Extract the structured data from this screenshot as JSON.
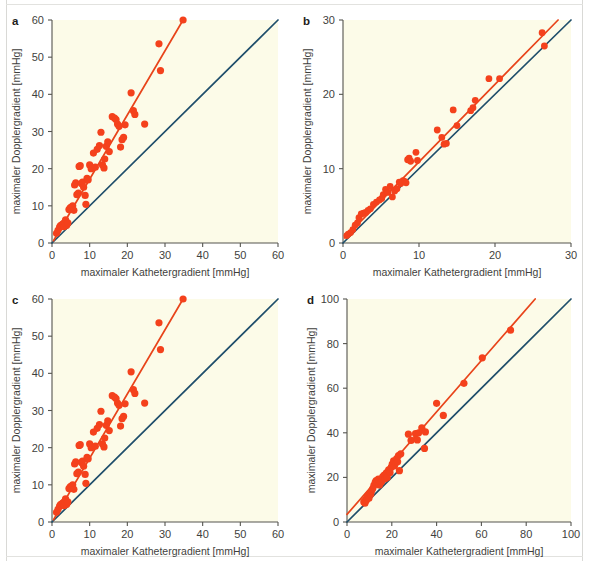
{
  "figure": {
    "background_color": "#ffffff",
    "plot_background_color": "#fcfbe8",
    "marker_color": "#f4411c",
    "fit_line_color": "#e8441a",
    "identity_line_color": "#1f4e6b",
    "axis_color": "#55554f"
  },
  "chart_data": [
    {
      "type": "scatter",
      "panel": "a",
      "title": "",
      "xlabel": "maximaler Kathetergradient [mmHg]",
      "ylabel": "maximaler Dopplergradient [mmHg]",
      "xlim": [
        0,
        60
      ],
      "ylim": [
        0,
        60
      ],
      "xticks": [
        0,
        10,
        20,
        30,
        40,
        50,
        60
      ],
      "yticks": [
        0,
        10,
        20,
        30,
        40,
        50,
        60
      ],
      "grid": false,
      "legend": "none",
      "annotations": [
        {
          "name": "identity-line",
          "kind": "line",
          "from": [
            0,
            0
          ],
          "to": [
            60,
            60
          ],
          "color": "#1f4e6b"
        },
        {
          "name": "regression-line",
          "kind": "line",
          "from": [
            0.4,
            0.6
          ],
          "to": [
            34.8,
            60.0
          ],
          "color": "#e8441a"
        }
      ],
      "x": [
        1.2,
        1.6,
        2.0,
        2.2,
        2.5,
        2.8,
        3.0,
        3.2,
        3.4,
        3.6,
        3.9,
        4.2,
        4.5,
        4.8,
        5.0,
        5.2,
        5.5,
        5.8,
        6.0,
        6.3,
        6.6,
        7.0,
        7.2,
        7.5,
        7.8,
        8.1,
        8.4,
        8.8,
        9.0,
        9.3,
        9.6,
        10.0,
        10.4,
        11.0,
        11.5,
        12.0,
        12.6,
        13.0,
        13.4,
        13.8,
        14.0,
        14.4,
        14.8,
        15.2,
        16.0,
        16.6,
        17.0,
        17.4,
        17.8,
        18.2,
        18.6,
        19.0,
        19.4,
        21.0,
        21.6,
        22.0,
        24.6,
        28.4,
        28.8,
        34.8
      ],
      "y": [
        2.6,
        3.4,
        4.2,
        4.6,
        4.8,
        5.0,
        5.2,
        4.4,
        5.6,
        6.2,
        4.8,
        5.4,
        9.0,
        9.4,
        9.6,
        9.2,
        10.0,
        8.8,
        15.6,
        16.2,
        13.0,
        13.4,
        20.6,
        20.8,
        16.0,
        16.4,
        15.0,
        12.8,
        10.4,
        17.4,
        17.0,
        21.0,
        20.0,
        24.2,
        20.4,
        25.2,
        26.2,
        29.8,
        21.0,
        20.2,
        22.6,
        26.0,
        27.2,
        24.6,
        34.0,
        33.6,
        33.2,
        32.0,
        31.4,
        25.8,
        27.8,
        28.4,
        31.8,
        40.4,
        35.6,
        34.6,
        32.0,
        53.6,
        46.4,
        60.0
      ]
    },
    {
      "type": "scatter",
      "panel": "b",
      "title": "",
      "xlabel": "maximaler Kathetergradient [mmHg]",
      "ylabel": "maximaler Dopplergradient [mmHg]",
      "xlim": [
        0,
        30
      ],
      "ylim": [
        0,
        30
      ],
      "xticks": [
        0,
        10,
        20,
        30
      ],
      "yticks": [
        0,
        10,
        20,
        30
      ],
      "grid": false,
      "legend": "none",
      "annotations": [
        {
          "name": "identity-line",
          "kind": "line",
          "from": [
            0,
            0
          ],
          "to": [
            30,
            30
          ],
          "color": "#1f4e6b"
        },
        {
          "name": "regression-line",
          "kind": "line",
          "from": [
            0.2,
            0.7
          ],
          "to": [
            28.3,
            30.0
          ],
          "color": "#e8441a"
        }
      ],
      "x": [
        0.5,
        0.7,
        1.0,
        1.3,
        1.6,
        1.9,
        2.1,
        2.4,
        2.7,
        3.0,
        3.3,
        3.6,
        4.0,
        4.4,
        4.8,
        5.1,
        5.3,
        5.6,
        5.9,
        6.2,
        6.5,
        6.8,
        7.1,
        7.4,
        7.6,
        7.9,
        8.1,
        8.3,
        8.5,
        8.7,
        8.9,
        9.6,
        9.8,
        12.4,
        13.0,
        13.3,
        13.6,
        14.5,
        15.0,
        16.8,
        17.1,
        17.4,
        19.2,
        20.6,
        26.2,
        26.5
      ],
      "y": [
        1.0,
        1.2,
        1.4,
        1.8,
        2.4,
        2.7,
        3.4,
        3.9,
        4.0,
        4.1,
        4.4,
        4.6,
        5.2,
        5.5,
        5.8,
        6.0,
        6.5,
        7.2,
        6.8,
        7.6,
        6.2,
        7.0,
        7.3,
        8.2,
        8.0,
        8.4,
        8.3,
        8.1,
        11.2,
        11.4,
        11.0,
        12.2,
        11.1,
        15.2,
        14.2,
        13.3,
        13.4,
        17.9,
        15.8,
        17.8,
        18.2,
        19.2,
        22.1,
        22.1,
        28.3,
        26.5
      ]
    },
    {
      "type": "scatter",
      "panel": "c",
      "title": "",
      "xlabel": "maximaler Kathetergradient [mmHg]",
      "ylabel": "maximaler Dopplergradient [mmHg]",
      "xlim": [
        0,
        60
      ],
      "ylim": [
        0,
        60
      ],
      "xticks": [
        0,
        10,
        20,
        30,
        40,
        50,
        60
      ],
      "yticks": [
        0,
        10,
        20,
        30,
        40,
        50,
        60
      ],
      "grid": false,
      "legend": "none",
      "annotations": [
        {
          "name": "identity-line",
          "kind": "line",
          "from": [
            0,
            0
          ],
          "to": [
            60,
            60
          ],
          "color": "#1f4e6b"
        },
        {
          "name": "regression-line",
          "kind": "line",
          "from": [
            0.4,
            0.6
          ],
          "to": [
            34.8,
            60.0
          ],
          "color": "#e8441a"
        }
      ],
      "x": [
        1.2,
        1.6,
        2.0,
        2.2,
        2.5,
        2.8,
        3.0,
        3.2,
        3.4,
        3.6,
        3.9,
        4.2,
        4.5,
        4.8,
        5.0,
        5.2,
        5.5,
        5.8,
        6.0,
        6.3,
        6.6,
        7.0,
        7.2,
        7.5,
        7.8,
        8.1,
        8.4,
        8.8,
        9.0,
        9.3,
        9.6,
        10.0,
        10.4,
        11.0,
        11.5,
        12.0,
        12.6,
        13.0,
        13.4,
        13.8,
        14.0,
        14.4,
        14.8,
        15.2,
        16.0,
        16.6,
        17.0,
        17.4,
        17.8,
        18.2,
        18.6,
        19.0,
        19.4,
        21.0,
        21.6,
        22.0,
        24.6,
        28.4,
        28.8,
        34.8
      ],
      "y": [
        2.6,
        3.4,
        4.2,
        4.6,
        4.8,
        5.0,
        5.2,
        4.4,
        5.6,
        6.2,
        4.8,
        5.4,
        9.0,
        9.4,
        9.6,
        9.2,
        10.0,
        8.8,
        15.6,
        16.2,
        13.0,
        13.4,
        20.6,
        20.8,
        16.0,
        16.4,
        15.0,
        12.8,
        10.4,
        17.4,
        17.0,
        21.0,
        20.0,
        24.2,
        20.4,
        25.2,
        26.2,
        29.8,
        21.0,
        20.2,
        22.6,
        26.0,
        27.2,
        24.6,
        34.0,
        33.6,
        33.2,
        32.0,
        31.4,
        25.8,
        27.8,
        28.4,
        31.8,
        40.4,
        35.6,
        34.6,
        32.0,
        53.6,
        46.4,
        60.0
      ]
    },
    {
      "type": "scatter",
      "panel": "d",
      "title": "",
      "xlabel": "maximaler Kathetergradient [mmHg]",
      "ylabel": "maximaler Dopplergradient [mmHg]",
      "xlim": [
        0,
        100
      ],
      "ylim": [
        0,
        100
      ],
      "xticks": [
        0,
        20,
        40,
        60,
        80,
        100
      ],
      "yticks": [
        0,
        20,
        40,
        60,
        80,
        100
      ],
      "grid": false,
      "legend": "none",
      "annotations": [
        {
          "name": "identity-line",
          "kind": "line",
          "from": [
            0,
            0
          ],
          "to": [
            100,
            100
          ],
          "color": "#1f4e6b"
        },
        {
          "name": "regression-line",
          "kind": "line",
          "from": [
            0.0,
            3.4
          ],
          "to": [
            84.0,
            100.0
          ],
          "color": "#e8441a"
        }
      ],
      "x": [
        7.5,
        8.0,
        8.3,
        8.6,
        9.0,
        9.4,
        9.8,
        10.2,
        10.6,
        11.0,
        11.5,
        12.0,
        12.6,
        13.0,
        13.5,
        14.0,
        14.5,
        15.0,
        15.5,
        16.0,
        16.6,
        17.0,
        17.6,
        18.0,
        18.6,
        19.2,
        19.8,
        20.2,
        20.8,
        21.2,
        21.8,
        22.2,
        22.6,
        23.0,
        23.4,
        24.0,
        27.4,
        28.6,
        30.6,
        31.4,
        32.0,
        33.4,
        34.6,
        35.0,
        40.0,
        43.0,
        52.2,
        60.4,
        73.0
      ],
      "y": [
        9.0,
        8.4,
        10.0,
        9.6,
        11.0,
        12.0,
        10.6,
        13.0,
        12.4,
        14.0,
        15.0,
        16.4,
        17.8,
        18.6,
        18.0,
        19.2,
        16.6,
        17.6,
        18.2,
        20.4,
        21.0,
        19.4,
        22.0,
        20.0,
        23.4,
        22.2,
        24.6,
        26.0,
        27.4,
        25.2,
        26.6,
        28.4,
        27.0,
        29.8,
        23.0,
        30.6,
        39.4,
        36.6,
        39.6,
        36.8,
        40.0,
        42.2,
        33.0,
        40.4,
        53.2,
        47.8,
        62.2,
        73.6,
        86.0
      ]
    }
  ]
}
